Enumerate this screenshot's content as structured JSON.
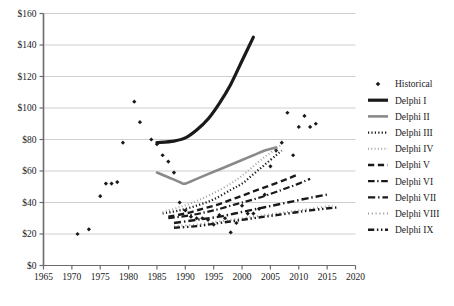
{
  "chart_data": {
    "type": "scatter",
    "title": "",
    "subtitle": "",
    "xlabel": "",
    "ylabel": "",
    "xlim": [
      1965,
      2020
    ],
    "ylim": [
      0,
      160
    ],
    "grid": true,
    "grid_axis": "y",
    "legend_position": "right",
    "x_ticks": [
      1965,
      1970,
      1975,
      1980,
      1985,
      1990,
      1995,
      2000,
      2005,
      2010,
      2015,
      2020
    ],
    "x_tick_labels": [
      "1965",
      "1970",
      "1975",
      "1980",
      "1985",
      "1990",
      "1995",
      "2000",
      "2005",
      "2010",
      "2015",
      "2020"
    ],
    "y_ticks": [
      0,
      20,
      40,
      60,
      80,
      100,
      120,
      140,
      160
    ],
    "y_tick_labels": [
      "$0",
      "$20",
      "$40",
      "$60",
      "$80",
      "$100",
      "$120",
      "$140",
      "$160"
    ],
    "colors": {
      "axis": "#6b6b6b",
      "grid": "#cfcfcf",
      "black": "#1a1a1a",
      "gray": "#8a8a8a",
      "light_gray": "#b0b0b0",
      "text": "#1a1a1a",
      "background": "#ffffff"
    },
    "series": [
      {
        "name": "Historical",
        "legend_label": "Historical",
        "style": "markers",
        "marker": "diamond",
        "color": "#1a1a1a",
        "width": 0,
        "points": [
          [
            1971,
            20
          ],
          [
            1973,
            23
          ],
          [
            1975,
            44
          ],
          [
            1976,
            52
          ],
          [
            1977,
            52
          ],
          [
            1978,
            53
          ],
          [
            1979,
            78
          ],
          [
            1981,
            104
          ],
          [
            1982,
            91
          ],
          [
            1984,
            80
          ],
          [
            1985,
            77
          ],
          [
            1986,
            70
          ],
          [
            1987,
            66
          ],
          [
            1988,
            59
          ],
          [
            1989,
            40
          ],
          [
            1990,
            35
          ],
          [
            1991,
            31
          ],
          [
            1992,
            30
          ],
          [
            1993,
            30
          ],
          [
            1994,
            29
          ],
          [
            1995,
            26
          ],
          [
            1996,
            32
          ],
          [
            1997,
            30
          ],
          [
            1998,
            21
          ],
          [
            1999,
            27
          ],
          [
            2000,
            38
          ],
          [
            2001,
            33
          ],
          [
            2002,
            33
          ],
          [
            2003,
            36
          ],
          [
            2004,
            45
          ],
          [
            2005,
            63
          ],
          [
            2006,
            73
          ],
          [
            2007,
            78
          ],
          [
            2008,
            97
          ],
          [
            2009,
            70
          ],
          [
            2010,
            88
          ],
          [
            2011,
            95
          ],
          [
            2012,
            88
          ],
          [
            2013,
            90
          ]
        ]
      },
      {
        "name": "Delphi I",
        "legend_label": "Delphi I",
        "style": "solid",
        "marker": "none",
        "color": "#1a1a1a",
        "width": 3.2,
        "points": [
          [
            1985,
            78
          ],
          [
            1988,
            79
          ],
          [
            1990,
            81
          ],
          [
            1992,
            86
          ],
          [
            1994,
            93
          ],
          [
            1996,
            103
          ],
          [
            1998,
            115
          ],
          [
            2000,
            130
          ],
          [
            2002,
            145
          ]
        ]
      },
      {
        "name": "Delphi II",
        "legend_label": "Delphi II",
        "style": "solid",
        "marker": "none",
        "color": "#8a8a8a",
        "width": 2.6,
        "points": [
          [
            1985,
            59
          ],
          [
            1987,
            56
          ],
          [
            1989,
            53
          ],
          [
            1990,
            52
          ],
          [
            1992,
            55
          ],
          [
            1994,
            58
          ],
          [
            1996,
            61
          ],
          [
            1998,
            64
          ],
          [
            2000,
            67
          ],
          [
            2002,
            70
          ],
          [
            2004,
            73
          ],
          [
            2006,
            75
          ]
        ]
      },
      {
        "name": "Delphi III",
        "legend_label": "Delphi III",
        "style": "dotted",
        "marker": "none",
        "color": "#1a1a1a",
        "width": 2.2,
        "points": [
          [
            1986,
            33
          ],
          [
            1989,
            35
          ],
          [
            1992,
            38
          ],
          [
            1995,
            42
          ],
          [
            1998,
            48
          ],
          [
            2000,
            52
          ],
          [
            2002,
            58
          ],
          [
            2004,
            64
          ],
          [
            2006,
            70
          ],
          [
            2007,
            73
          ]
        ]
      },
      {
        "name": "Delphi IV",
        "legend_label": "Delphi IV",
        "style": "fine-dotted",
        "marker": "none",
        "color": "#9a9a9a",
        "width": 2.0,
        "points": [
          [
            1986,
            34
          ],
          [
            1989,
            37
          ],
          [
            1992,
            41
          ],
          [
            1995,
            46
          ],
          [
            1998,
            52
          ],
          [
            2000,
            57
          ],
          [
            2002,
            63
          ],
          [
            2004,
            69
          ],
          [
            2006,
            74
          ],
          [
            2007,
            77
          ]
        ]
      },
      {
        "name": "Delphi V",
        "legend_label": "Delphi V",
        "style": "dashed",
        "marker": "none",
        "color": "#1a1a1a",
        "width": 2.4,
        "points": [
          [
            1987,
            31
          ],
          [
            1990,
            33
          ],
          [
            1993,
            36
          ],
          [
            1996,
            39
          ],
          [
            1999,
            43
          ],
          [
            2002,
            47
          ],
          [
            2005,
            51
          ],
          [
            2008,
            55
          ],
          [
            2010,
            58
          ]
        ]
      },
      {
        "name": "Delphi VI",
        "legend_label": "Delphi VI",
        "style": "dash-dot",
        "marker": "none",
        "color": "#1a1a1a",
        "width": 2.2,
        "points": [
          [
            1987,
            30
          ],
          [
            1991,
            32
          ],
          [
            1995,
            35
          ],
          [
            1999,
            39
          ],
          [
            2003,
            43
          ],
          [
            2007,
            48
          ],
          [
            2010,
            52
          ],
          [
            2012,
            55
          ]
        ]
      },
      {
        "name": "Delphi VII",
        "legend_label": "Delphi VII",
        "style": "dash-dot",
        "marker": "none",
        "color": "#1a1a1a",
        "width": 2.4,
        "points": [
          [
            1988,
            27
          ],
          [
            1992,
            29
          ],
          [
            1996,
            31
          ],
          [
            2000,
            34
          ],
          [
            2004,
            37
          ],
          [
            2008,
            40
          ],
          [
            2012,
            43
          ],
          [
            2015,
            45
          ]
        ]
      },
      {
        "name": "Delphi VIII",
        "legend_label": "Delphi VIII",
        "style": "light-dotted",
        "marker": "none",
        "color": "#9a9a9a",
        "width": 2.0,
        "points": [
          [
            1988,
            25
          ],
          [
            1992,
            26
          ],
          [
            1996,
            28
          ],
          [
            2000,
            30
          ],
          [
            2004,
            32
          ],
          [
            2008,
            34
          ],
          [
            2012,
            36
          ],
          [
            2016,
            38
          ]
        ]
      },
      {
        "name": "Delphi IX",
        "legend_label": "Delphi IX",
        "style": "dash-dot-dot",
        "marker": "none",
        "color": "#1a1a1a",
        "width": 2.4,
        "points": [
          [
            1988,
            24
          ],
          [
            1992,
            25
          ],
          [
            1996,
            27
          ],
          [
            2000,
            29
          ],
          [
            2004,
            31
          ],
          [
            2008,
            33
          ],
          [
            2012,
            35
          ],
          [
            2017,
            37
          ]
        ]
      }
    ]
  }
}
